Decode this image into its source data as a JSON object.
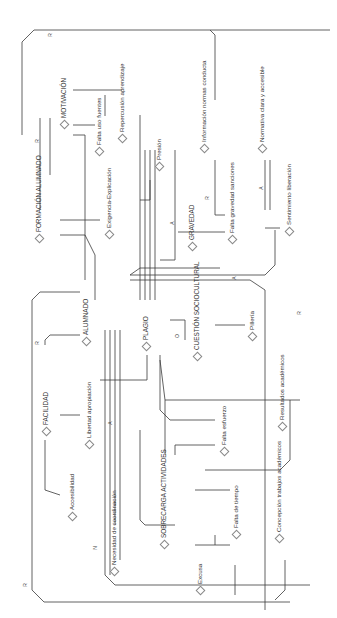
{
  "diagram": {
    "type": "causal-network",
    "orientation": "rotated-90-ccw",
    "nodes": [
      {
        "id": "repercusion",
        "label": "Repercusión aprendizaje"
      },
      {
        "id": "motivacion",
        "label": "MOTIVACIÓN"
      },
      {
        "id": "falta_uso_fuentes",
        "label": "Falta uso fuentes"
      },
      {
        "id": "presion",
        "label": "Presión"
      },
      {
        "id": "formacion",
        "label": "FORMACIÓN ALUMNADO"
      },
      {
        "id": "exigencia",
        "label": "Exigencia-Explicación"
      },
      {
        "id": "informacion",
        "label": "Información normas conducta"
      },
      {
        "id": "normativa",
        "label": "Normativa clara y accesible"
      },
      {
        "id": "gravedad",
        "label": "GRAVEDAD"
      },
      {
        "id": "falta_gravedad",
        "label": "Falta gravedad sanciones"
      },
      {
        "id": "sentimiento",
        "label": "Sentimiento liberación"
      },
      {
        "id": "alumnado",
        "label": "ALUMNADO"
      },
      {
        "id": "plagio",
        "label": "PLAGIO"
      },
      {
        "id": "cuestion",
        "label": "CUESTIÓN SOCIOCULTURAL"
      },
      {
        "id": "pilleria",
        "label": "Pillería"
      },
      {
        "id": "facilidad",
        "label": "FACILIDAD"
      },
      {
        "id": "libertad",
        "label": "Libertad apropiación"
      },
      {
        "id": "accesibilidad",
        "label": "Accesibilidad"
      },
      {
        "id": "resultados",
        "label": "Resultados académicos"
      },
      {
        "id": "falta_esfuerzo",
        "label": "Falta esfuerzo"
      },
      {
        "id": "necesidad",
        "label": "Necesidad de coordinación"
      },
      {
        "id": "sobrecarga",
        "label": "SOBRECARGA ACTIVIDADES"
      },
      {
        "id": "falta_tiempo",
        "label": "Falta de tiempo"
      },
      {
        "id": "excusa",
        "label": "Excusa"
      },
      {
        "id": "concepcion",
        "label": "Concepción trabajos académicos"
      }
    ],
    "edge_labels": [
      "R",
      "R",
      "R",
      "R",
      "R",
      "R",
      "A",
      "A",
      "A",
      "A",
      "N",
      "O"
    ]
  }
}
